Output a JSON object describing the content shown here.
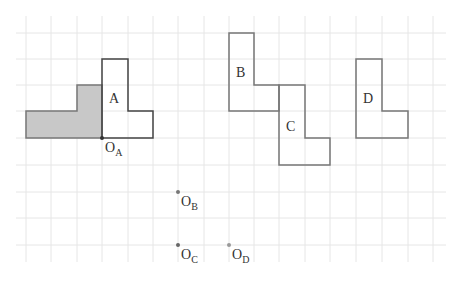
{
  "diagram": {
    "type": "grid-transformation",
    "grid": {
      "x_lines": [
        26,
        51,
        77,
        102,
        128,
        153,
        178,
        204,
        229,
        254,
        279,
        305,
        330,
        356,
        382,
        408,
        433
      ],
      "y_lines": [
        33,
        59,
        85,
        111,
        138,
        165,
        192,
        218,
        245
      ],
      "x_extent": [
        16,
        446
      ],
      "y_extent": [
        16,
        262
      ],
      "color": "#e6e6e6"
    },
    "shapes": [
      {
        "id": "shaded",
        "label": "",
        "fill": "#c8c8c8",
        "stroke": "#777777",
        "points": "26,111 77,111 77,85 102,85 102,138 26,138"
      },
      {
        "id": "A",
        "label": "A",
        "fill": "none",
        "stroke": "#444444",
        "points": "102,59 128,59 128,111 153,111 153,138 102,138"
      },
      {
        "id": "B",
        "label": "B",
        "fill": "none",
        "stroke": "#777777",
        "points": "229,33 254,33 254,85 279,85 279,111 229,111"
      },
      {
        "id": "C",
        "label": "C",
        "fill": "none",
        "stroke": "#777777",
        "points": "279,85 305,85 305,138 330,138 330,165 279,165"
      },
      {
        "id": "D",
        "label": "D",
        "fill": "none",
        "stroke": "#777777",
        "points": "356,59 382,59 382,111 408,111 408,138 356,138"
      }
    ],
    "labels": [
      {
        "id": "A",
        "text": "A",
        "x": 109,
        "y": 92
      },
      {
        "id": "B",
        "text": "B",
        "x": 236,
        "y": 66
      },
      {
        "id": "C",
        "text": "C",
        "x": 286,
        "y": 120
      },
      {
        "id": "D",
        "text": "D",
        "x": 363,
        "y": 92
      }
    ],
    "points": [
      {
        "id": "OA",
        "main": "O",
        "sub": "A",
        "x": 102,
        "y": 138,
        "color": "#333333",
        "lx": 105,
        "ly": 141
      },
      {
        "id": "OB",
        "main": "O",
        "sub": "B",
        "x": 178,
        "y": 192,
        "color": "#777777",
        "lx": 181,
        "ly": 195
      },
      {
        "id": "OC",
        "main": "O",
        "sub": "C",
        "x": 178,
        "y": 245,
        "color": "#666666",
        "lx": 181,
        "ly": 248
      },
      {
        "id": "OD",
        "main": "O",
        "sub": "D",
        "x": 229,
        "y": 245,
        "color": "#999999",
        "lx": 232,
        "ly": 248
      }
    ]
  }
}
